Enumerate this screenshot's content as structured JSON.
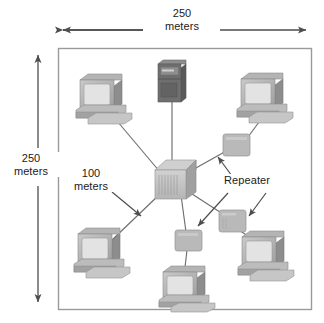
{
  "diagram": {
    "frame": {
      "name": "network-boundary",
      "width_label": {
        "value": "250",
        "unit": "meters"
      },
      "height_label": {
        "value": "250",
        "unit": "meters"
      }
    },
    "annotations": [
      {
        "id": "segment-length",
        "value": "100",
        "unit": "meters"
      },
      {
        "id": "repeater-callout",
        "text": "Repeater"
      }
    ],
    "colors": {
      "frame_border": "#9a9a9a",
      "link_line": "#6e6e6e",
      "arrow": "#4d4d4d",
      "text": "#1a1a1a",
      "device_light": "#d6d6d6",
      "device_mid": "#a8a8a8",
      "device_dark": "#8a8a8a",
      "screen": "#e3e3e3",
      "server_body": "#6f6f6f",
      "server_dark": "#5a5a5a",
      "repeater_fill": "#b9b9b9",
      "background": "#ffffff"
    },
    "nodes": [
      {
        "id": "server-top",
        "type": "server-tower",
        "label": "server",
        "x": 171,
        "y": 82
      },
      {
        "id": "pc-top-left",
        "type": "workstation",
        "label": "workstation",
        "x": 102,
        "y": 96
      },
      {
        "id": "pc-top-right",
        "type": "workstation",
        "label": "workstation",
        "x": 263,
        "y": 95
      },
      {
        "id": "hub-center",
        "type": "hub",
        "label": "hub",
        "x": 173,
        "y": 182
      },
      {
        "id": "pc-bottom-left",
        "type": "workstation",
        "label": "workstation",
        "x": 100,
        "y": 250
      },
      {
        "id": "pc-bottom-right",
        "type": "workstation",
        "label": "workstation",
        "x": 264,
        "y": 253
      },
      {
        "id": "pc-bottom-center",
        "type": "workstation",
        "label": "workstation",
        "x": 182,
        "y": 287
      },
      {
        "id": "repeater-right",
        "type": "repeater",
        "label": "Repeater",
        "x": 237,
        "y": 147
      },
      {
        "id": "repeater-bottom-right",
        "type": "repeater",
        "label": "Repeater",
        "x": 232,
        "y": 221
      },
      {
        "id": "repeater-bottom-center",
        "type": "repeater",
        "label": "Repeater",
        "x": 188,
        "y": 240
      }
    ],
    "links": [
      {
        "from": "hub-center",
        "to": "server-top"
      },
      {
        "from": "hub-center",
        "to": "pc-top-left"
      },
      {
        "from": "hub-center",
        "to": "repeater-right"
      },
      {
        "from": "repeater-right",
        "to": "pc-top-right"
      },
      {
        "from": "hub-center",
        "to": "pc-bottom-left"
      },
      {
        "from": "hub-center",
        "to": "repeater-bottom-center"
      },
      {
        "from": "repeater-bottom-center",
        "to": "pc-bottom-center"
      },
      {
        "from": "hub-center",
        "to": "repeater-bottom-right"
      },
      {
        "from": "repeater-bottom-right",
        "to": "pc-bottom-right"
      }
    ]
  }
}
